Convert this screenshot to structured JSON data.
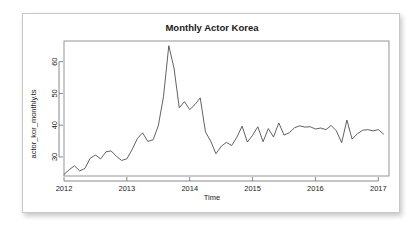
{
  "figure": {
    "title": "Monthly Actor Korea",
    "xlabel": "Time",
    "ylabel": "actor_kor_monthly.ts"
  },
  "chart_data": {
    "type": "line",
    "title": "Monthly Actor Korea",
    "xlabel": "Time",
    "ylabel": "actor_kor_monthly.ts",
    "grid": false,
    "legend": false,
    "legend_position": "none",
    "xlim": [
      2012.0,
      2017.17
    ],
    "ylim": [
      24.0,
      66.5
    ],
    "xticks": [
      2012,
      2013,
      2014,
      2015,
      2016,
      2017
    ],
    "xtick_labels": [
      "2012",
      "2013",
      "2014",
      "2015",
      "2016",
      "2017"
    ],
    "yticks": [
      30,
      40,
      50,
      60
    ],
    "ytick_labels": [
      "30",
      "40",
      "50",
      "60"
    ],
    "series": [
      {
        "name": "actor_kor_monthly.ts",
        "color": "#3a3a3a",
        "x": [
          2012.0,
          2012.083,
          2012.167,
          2012.25,
          2012.333,
          2012.417,
          2012.5,
          2012.583,
          2012.667,
          2012.75,
          2012.833,
          2012.917,
          2013.0,
          2013.083,
          2013.167,
          2013.25,
          2013.333,
          2013.417,
          2013.5,
          2013.583,
          2013.667,
          2013.75,
          2013.833,
          2013.917,
          2014.0,
          2014.083,
          2014.167,
          2014.25,
          2014.333,
          2014.417,
          2014.5,
          2014.583,
          2014.667,
          2014.75,
          2014.833,
          2014.917,
          2015.0,
          2015.083,
          2015.167,
          2015.25,
          2015.333,
          2015.417,
          2015.5,
          2015.583,
          2015.667,
          2015.75,
          2015.833,
          2015.917,
          2016.0,
          2016.083,
          2016.167,
          2016.25,
          2016.333,
          2016.417,
          2016.5,
          2016.583,
          2016.667,
          2016.75,
          2016.833,
          2016.917,
          2017.0,
          2017.083
        ],
        "y": [
          24.5,
          26.0,
          27.2,
          25.6,
          26.4,
          29.6,
          30.6,
          29.4,
          31.6,
          31.9,
          30.2,
          28.9,
          29.4,
          32.3,
          35.8,
          37.6,
          34.9,
          35.4,
          39.8,
          49.0,
          65.0,
          58.0,
          45.5,
          47.4,
          44.9,
          46.5,
          48.6,
          37.9,
          35.0,
          31.0,
          33.3,
          34.6,
          33.6,
          36.2,
          39.7,
          34.7,
          36.8,
          39.5,
          34.8,
          38.9,
          36.3,
          40.7,
          36.9,
          37.6,
          39.2,
          39.8,
          39.4,
          39.5,
          38.8,
          39.1,
          38.6,
          39.9,
          38.2,
          34.5,
          41.6,
          35.6,
          37.3,
          38.4,
          38.6,
          38.2,
          38.6,
          37.2
        ]
      }
    ]
  }
}
